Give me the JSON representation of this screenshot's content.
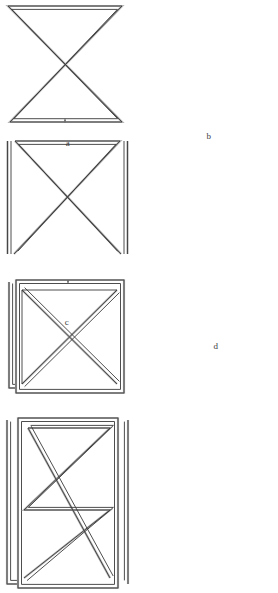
{
  "plate": {
    "width": 278,
    "height": 361,
    "background_color": "#ffffff",
    "line_color": "#3a3a3a",
    "shade_color": "#b4b4b4",
    "description": "Four line-drawn wire-loop figures labelled a, b, c, d, each rendered as a closed double-line ribbon path."
  },
  "figures": [
    {
      "id": "a",
      "label": "a",
      "name": "bowtie-figure",
      "description": "Bowtie / hourglass: top horizontal bar and bottom horizontal bar joined by two crossing diagonals, drawn as one closed ribbon loop with a seam mark at the middle of the bottom bar.",
      "has_seam": true,
      "seam_location": "bottom-center"
    },
    {
      "id": "b",
      "label": "b",
      "name": "rectangle-with-x-open-sides-figure",
      "description": "Rectangle outline with both diagonals forming an X; the left and right vertical sides stand slightly apart from the corners as separate ribbon strokes.",
      "has_seam": false,
      "seam_location": ""
    },
    {
      "id": "c",
      "label": "c",
      "name": "square-with-x-doubled-edge-figure",
      "description": "Square frame containing an X of diagonals, with an extra offset loop doubling the left edge; a seam mark sits at the middle of the top bar.",
      "has_seam": true,
      "seam_location": "top-center"
    },
    {
      "id": "d",
      "label": "d",
      "name": "tall-rectangle-double-x-figure",
      "description": "Tall rectangle frame enclosing a double-crossing zigzag: two X crossings with a diamond between them, plus offset left and right vertical ribbons.",
      "has_seam": false,
      "seam_location": ""
    }
  ]
}
